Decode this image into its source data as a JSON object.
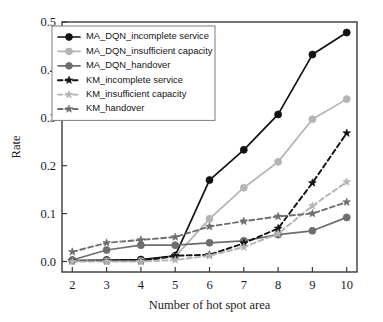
{
  "chart_data": {
    "type": "line",
    "title": "",
    "xlabel": "Number of hot spot area",
    "ylabel": "Rate",
    "x": [
      2,
      3,
      4,
      5,
      6,
      7,
      8,
      9,
      10
    ],
    "xlim": [
      1.7,
      10.3
    ],
    "ylim": [
      -0.022,
      0.5
    ],
    "xticks": [
      "2",
      "3",
      "4",
      "5",
      "6",
      "7",
      "8",
      "9",
      "10"
    ],
    "yticks": [
      "0.0",
      "0.1",
      "0.2",
      "0.3",
      "0.4",
      "0.5"
    ],
    "ytick_values": [
      0.0,
      0.1,
      0.2,
      0.3,
      0.4,
      0.5
    ],
    "grid": false,
    "legend_position": "upper left",
    "series": [
      {
        "name": "MA_DQN_incomplete service",
        "color": "#121212",
        "style": "solid",
        "marker": "circle",
        "values": [
          0.002,
          0.003,
          0.004,
          0.012,
          0.17,
          0.233,
          0.307,
          0.432,
          0.478
        ]
      },
      {
        "name": "MA_DQN_insufficient capacity",
        "color": "#b4b4b4",
        "style": "solid",
        "marker": "circle",
        "values": [
          0.002,
          0.001,
          0.001,
          0.01,
          0.089,
          0.154,
          0.208,
          0.297,
          0.339
        ]
      },
      {
        "name": "MA_DQN_handover",
        "color": "#6e6e6e",
        "style": "solid",
        "marker": "circle",
        "values": [
          0.003,
          0.024,
          0.034,
          0.034,
          0.039,
          0.043,
          0.056,
          0.064,
          0.092
        ]
      },
      {
        "name": "KM_incomplete service",
        "color": "#121212",
        "style": "dashed",
        "marker": "star",
        "values": [
          0.001,
          0.001,
          0.001,
          0.012,
          0.014,
          0.038,
          0.069,
          0.164,
          0.268
        ]
      },
      {
        "name": "KM_insufficient capacity",
        "color": "#b4b4b4",
        "style": "dashed",
        "marker": "star",
        "values": [
          0.0,
          0.0,
          0.0,
          0.003,
          0.012,
          0.03,
          0.058,
          0.116,
          0.166
        ]
      },
      {
        "name": "KM_handover",
        "color": "#6e6e6e",
        "style": "dashed",
        "marker": "star",
        "values": [
          0.02,
          0.039,
          0.045,
          0.051,
          0.073,
          0.084,
          0.094,
          0.1,
          0.124
        ]
      }
    ]
  }
}
